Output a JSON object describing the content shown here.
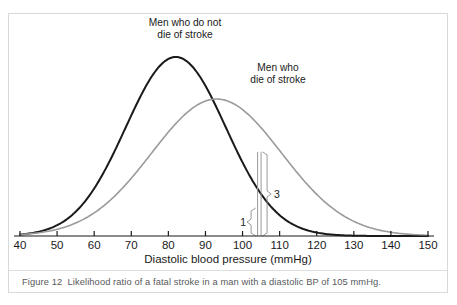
{
  "figure": {
    "caption_label": "Figure 12",
    "caption_text": "Likelihood ratio of a fatal stroke in a man with a diastolic BP of 105 mmHg."
  },
  "chart_data": {
    "type": "line",
    "title": "",
    "xlabel": "Diastolic blood pressure (mmHg)",
    "ylabel": "",
    "xlim": [
      40,
      150
    ],
    "ylim": [
      0,
      1.0
    ],
    "grid": false,
    "legend_position": "inline-annotations",
    "xticks": [
      40,
      50,
      60,
      70,
      80,
      90,
      100,
      110,
      120,
      130,
      140,
      150
    ],
    "xticklabels": [
      "40",
      "50",
      "60",
      "70",
      "80",
      "90",
      "100",
      "110",
      "120",
      "130",
      "140",
      "150"
    ],
    "yticks": [],
    "yticklabels": [],
    "series": [
      {
        "name": "Men who do not die of stroke",
        "label_line1": "Men who do not",
        "label_line2": "die of stroke",
        "color": "#1a1a1a",
        "linewidth": 2.0,
        "distribution": "normal",
        "mean": 82,
        "sd": 13.5,
        "peak_height": 1.0,
        "value_at_105": 0.156
      },
      {
        "name": "Men who die of stroke",
        "label_line1": "Men who",
        "label_line2": "die of stroke",
        "color": "#9a9a9a",
        "linewidth": 1.6,
        "distribution": "normal",
        "mean": 93,
        "sd": 17.5,
        "peak_height": 0.765,
        "value_at_105": 0.47
      }
    ],
    "annotations": [
      {
        "name": "ratio-numerator",
        "text": "3",
        "marker_x": 105,
        "spans_series": "Men who die of stroke"
      },
      {
        "name": "ratio-denominator",
        "text": "1",
        "marker_x": 105,
        "spans_series": "Men who do not die of stroke"
      }
    ]
  }
}
